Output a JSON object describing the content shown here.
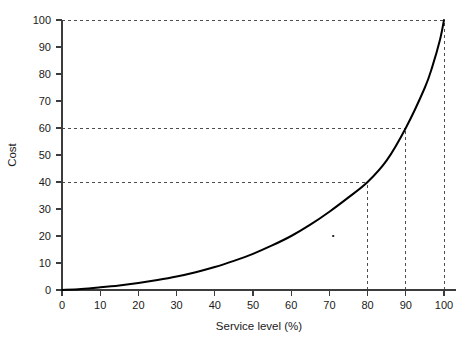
{
  "chart_data": {
    "type": "line",
    "title": "",
    "xlabel": "Service level (%)",
    "ylabel": "Cost",
    "xlim": [
      0,
      100
    ],
    "ylim": [
      0,
      100
    ],
    "grid": false,
    "legend": "none",
    "xticks": [
      0,
      10,
      20,
      30,
      40,
      50,
      60,
      70,
      80,
      90,
      100
    ],
    "yticks": [
      0,
      10,
      20,
      30,
      40,
      50,
      60,
      70,
      80,
      90,
      100
    ],
    "xtick_labels": [
      "0",
      "10",
      "20",
      "30",
      "40",
      "50",
      "60",
      "70",
      "80",
      "90",
      "100"
    ],
    "ytick_labels": [
      "0",
      "10",
      "20",
      "30",
      "40",
      "50",
      "60",
      "70",
      "80",
      "90",
      "100"
    ],
    "series": [
      {
        "name": "Cost curve",
        "color": "#000000",
        "x": [
          0,
          5,
          10,
          15,
          20,
          25,
          30,
          35,
          40,
          45,
          50,
          55,
          60,
          65,
          70,
          75,
          80,
          85,
          90,
          95,
          97,
          99,
          100
        ],
        "values": [
          0,
          0.4,
          1.0,
          1.7,
          2.6,
          3.7,
          5.0,
          6.6,
          8.5,
          10.8,
          13.4,
          16.5,
          20.0,
          24.2,
          29.0,
          34.3,
          40.0,
          48.0,
          60.0,
          75.0,
          83.0,
          93.0,
          100.0
        ]
      }
    ],
    "reference_lines": [
      {
        "name": "cost-40-guide",
        "orientation": "horizontal",
        "value": 40,
        "from_x": 0,
        "to_x": 80,
        "style": "dashed"
      },
      {
        "name": "cost-60-guide",
        "orientation": "horizontal",
        "value": 60,
        "from_x": 0,
        "to_x": 90,
        "style": "dashed"
      },
      {
        "name": "cost-100-guide",
        "orientation": "horizontal",
        "value": 100,
        "from_x": 0,
        "to_x": 100,
        "style": "dashed"
      },
      {
        "name": "service-80-guide",
        "orientation": "vertical",
        "value": 80,
        "from_y": 0,
        "to_y": 40,
        "style": "dashed"
      },
      {
        "name": "service-90-guide",
        "orientation": "vertical",
        "value": 90,
        "from_y": 0,
        "to_y": 60,
        "style": "dashed"
      },
      {
        "name": "service-100-guide",
        "orientation": "vertical",
        "value": 100,
        "from_y": 0,
        "to_y": 100,
        "style": "dashed"
      }
    ],
    "annotations": [
      {
        "name": "stray-speck",
        "x": 71,
        "y": 20,
        "label": ""
      }
    ],
    "callouts": [
      {
        "service_level": 80,
        "cost": 40
      },
      {
        "service_level": 90,
        "cost": 60
      },
      {
        "service_level": 100,
        "cost": 100
      }
    ]
  },
  "colors": {
    "curve": "#000000",
    "axis": "#3c3c3c",
    "guide": "#4d4d4d",
    "background": "#ffffff",
    "text": "#1a1a1a"
  }
}
